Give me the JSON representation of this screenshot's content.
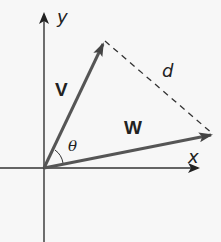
{
  "diagram": {
    "labels": {
      "y_axis": "y",
      "x_axis": "x",
      "vector_v": "V",
      "vector_w": "W",
      "distance": "d",
      "angle": "θ"
    },
    "colors": {
      "background": "#f7f7f7",
      "axis": "#333333",
      "vector": "#4a4a4a",
      "dashed": "#333333"
    },
    "geometry": {
      "origin": [
        44,
        168
      ],
      "v_tip": [
        103,
        43
      ],
      "w_tip": [
        212,
        135
      ],
      "x_axis_end": [
        200,
        168
      ],
      "y_axis_end": [
        44,
        12
      ]
    }
  }
}
